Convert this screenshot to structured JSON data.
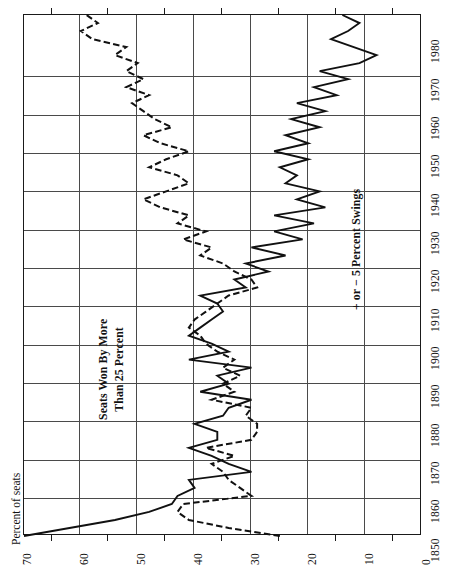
{
  "chart_data": {
    "type": "line",
    "title": "",
    "xlabel": "",
    "ylabel": "Percent of seats",
    "orientation": "rotated-90-ccw",
    "xlim": [
      1850,
      1980
    ],
    "ylim": [
      0,
      70
    ],
    "x_ticks": [
      1850,
      1860,
      1870,
      1880,
      1890,
      1900,
      1910,
      1920,
      1930,
      1940,
      1950,
      1960,
      1970,
      1980
    ],
    "y_ticks": [
      0,
      10,
      20,
      30,
      40,
      50,
      60,
      70
    ],
    "y_minor_ticks": [
      5,
      15,
      25,
      35,
      45,
      55,
      65
    ],
    "grid": true,
    "legend": "inline-annotations",
    "series": [
      {
        "name": "Seats Won By More Than 25 Percent",
        "style": "dashed",
        "x": [
          1850,
          1852,
          1854,
          1856,
          1858,
          1860,
          1862,
          1864,
          1866,
          1868,
          1870,
          1872,
          1874,
          1876,
          1878,
          1880,
          1882,
          1884,
          1886,
          1888,
          1890,
          1892,
          1894,
          1896,
          1898,
          1900,
          1902,
          1904,
          1906,
          1908,
          1910,
          1912,
          1914,
          1916,
          1918,
          1920,
          1922,
          1924,
          1926,
          1928,
          1930,
          1932,
          1934,
          1936,
          1938,
          1940,
          1942,
          1944,
          1946,
          1948,
          1950,
          1952,
          1954,
          1956,
          1958,
          1960,
          1962,
          1964,
          1966,
          1968,
          1970,
          1972,
          1974,
          1976,
          1978,
          1980
        ],
        "values": [
          25,
          34,
          41,
          43,
          42,
          30,
          32,
          34,
          35,
          37,
          33,
          38,
          30,
          29,
          29,
          31,
          30,
          37,
          33,
          35,
          32,
          35,
          33,
          36,
          38,
          39,
          41,
          40,
          38,
          36,
          34,
          29,
          30,
          33,
          35,
          39,
          37,
          42,
          38,
          43,
          41,
          46,
          49,
          45,
          41,
          43,
          48,
          45,
          41,
          46,
          49,
          44,
          47,
          49,
          51,
          48,
          52,
          49,
          52,
          50,
          54,
          52,
          58,
          60,
          57,
          59
        ]
      },
      {
        "name": "+ or − 5 Percent Swings",
        "style": "solid",
        "x": [
          1850,
          1852,
          1854,
          1856,
          1858,
          1860,
          1862,
          1864,
          1866,
          1868,
          1870,
          1872,
          1874,
          1876,
          1878,
          1880,
          1882,
          1884,
          1886,
          1888,
          1890,
          1892,
          1894,
          1896,
          1898,
          1900,
          1902,
          1904,
          1906,
          1908,
          1910,
          1912,
          1914,
          1916,
          1918,
          1920,
          1922,
          1924,
          1926,
          1928,
          1930,
          1932,
          1934,
          1936,
          1938,
          1940,
          1942,
          1944,
          1946,
          1948,
          1950,
          1952,
          1954,
          1956,
          1958,
          1960,
          1962,
          1964,
          1966,
          1968,
          1970,
          1972,
          1974,
          1976,
          1978,
          1980
        ],
        "values": [
          70,
          62,
          54,
          48,
          44,
          43,
          40,
          41,
          30,
          34,
          37,
          41,
          36,
          36,
          40,
          35,
          34,
          30,
          39,
          34,
          36,
          30,
          41,
          34,
          37,
          41,
          39,
          37,
          35,
          36,
          39,
          31,
          33,
          27,
          31,
          24,
          30,
          21,
          26,
          19,
          26,
          17,
          22,
          18,
          24,
          22,
          25,
          20,
          26,
          20,
          24,
          18,
          23,
          17,
          22,
          15,
          19,
          13,
          18,
          11,
          8,
          12,
          16,
          13,
          11,
          14
        ]
      }
    ],
    "annotations": [
      {
        "name": "dashed-series-label",
        "text_line1": "Seats Won By More",
        "text_line2": "Than 25 Percent"
      },
      {
        "name": "solid-series-label",
        "text": "+ or − 5 Percent Swings"
      }
    ]
  },
  "axes": {
    "value_axis": {
      "title": "Percent of seats",
      "labels": [
        "70",
        "60",
        "50",
        "40",
        "30",
        "20",
        "10",
        "0"
      ]
    },
    "year_axis": {
      "labels": [
        "1850",
        "1860",
        "1870",
        "1880",
        "1890",
        "1900",
        "1910",
        "1920",
        "1930",
        "1940",
        "1950",
        "1960",
        "1970",
        "1980"
      ]
    }
  },
  "colors": {
    "ink": "#111111",
    "grid": "#4a4a4a",
    "background": "#ffffff"
  }
}
